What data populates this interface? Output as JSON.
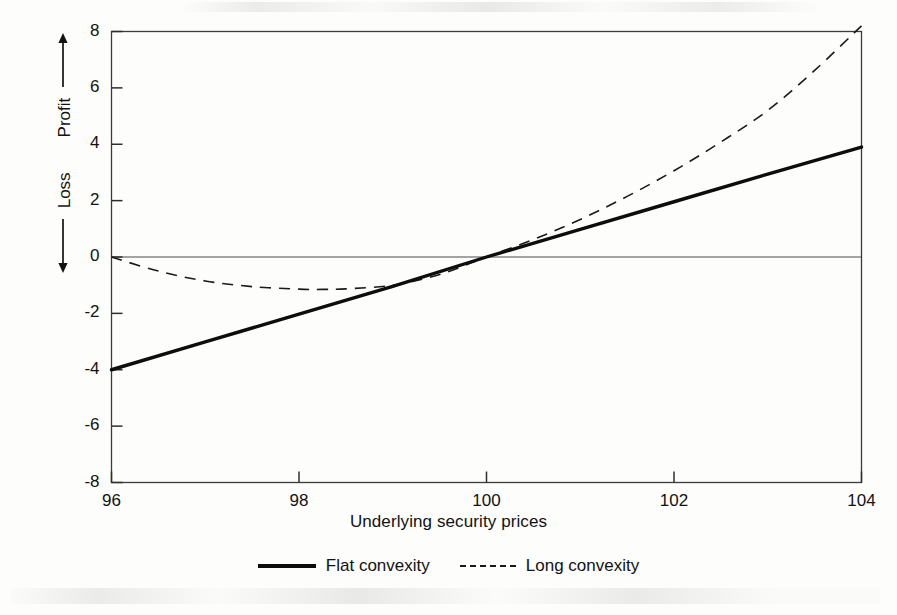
{
  "figure": {
    "background_color": "#fdfdfc",
    "ink_color": "#111111"
  },
  "axes": {
    "x_title": "Underlying security prices",
    "y_title_positive": "Profit",
    "y_title_negative": "Loss",
    "y_arrow_up": "arrow-up-icon",
    "y_arrow_down": "arrow-down-icon",
    "x_ticks": [
      "96",
      "98",
      "100",
      "102",
      "104"
    ],
    "y_ticks": [
      "8",
      "6",
      "4",
      "2",
      "0",
      "-2",
      "-4",
      "-6",
      "-8"
    ]
  },
  "legend": {
    "entries": [
      {
        "label": "Flat convexity",
        "style": "solid",
        "color": "#0d0d0d"
      },
      {
        "label": "Long convexity",
        "style": "dashed",
        "color": "#1a1a1a"
      }
    ]
  },
  "chart_data": {
    "type": "line",
    "title": "",
    "xlabel": "Underlying security prices",
    "ylabel": "Loss ← | Profit →",
    "xlim": [
      96,
      104
    ],
    "ylim": [
      -8,
      8
    ],
    "xticks": [
      96,
      98,
      100,
      102,
      104
    ],
    "yticks": [
      -8,
      -6,
      -4,
      -2,
      0,
      2,
      4,
      6,
      8
    ],
    "grid": false,
    "legend_position": "below-axis-center",
    "zero_line": 0,
    "series": [
      {
        "name": "Flat convexity",
        "style": "solid",
        "color": "#0d0d0d",
        "linewidth": 3.4,
        "x": [
          96,
          97,
          98,
          99,
          100,
          101,
          102,
          103,
          104
        ],
        "values": [
          -4.0,
          -3.01,
          -2.03,
          -1.04,
          0.0,
          0.98,
          1.96,
          2.94,
          3.9
        ]
      },
      {
        "name": "Long convexity",
        "style": "dashed",
        "color": "#1a1a1a",
        "linewidth": 1.6,
        "x": [
          96,
          96.5,
          97,
          97.5,
          98,
          98.25,
          98.5,
          99,
          99.5,
          100,
          100.5,
          101,
          101.5,
          102,
          102.5,
          103,
          103.5,
          104
        ],
        "values": [
          0.0,
          -0.5,
          -0.85,
          -1.05,
          -1.14,
          -1.15,
          -1.13,
          -1.0,
          -0.62,
          0.0,
          0.62,
          1.33,
          2.15,
          3.06,
          4.08,
          5.2,
          6.62,
          8.2
        ]
      }
    ]
  }
}
